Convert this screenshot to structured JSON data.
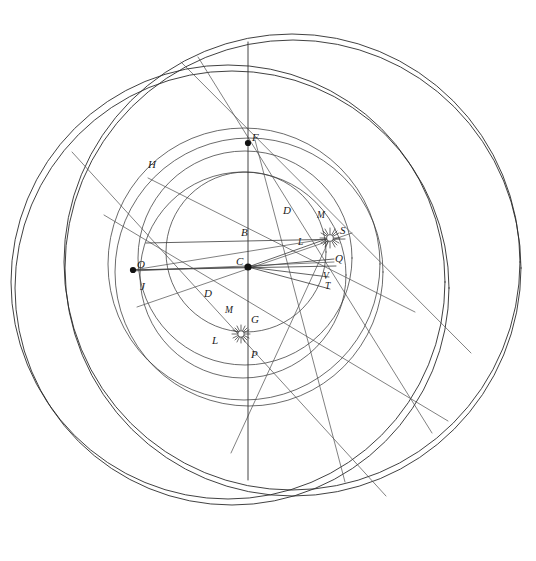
{
  "figure": {
    "canvas": {
      "width": 536,
      "height": 561
    },
    "background_color": "#ffffff",
    "ink_color": "#2b2b2b"
  },
  "points": [
    {
      "id": "F",
      "label": "F",
      "x": 248,
      "y": 143,
      "label_x": 252,
      "label_y": 134,
      "marker": "dot"
    },
    {
      "id": "H",
      "label": "H",
      "x": 150,
      "y": 175,
      "label_x": 150,
      "label_y": 161,
      "marker": "none"
    },
    {
      "id": "D_upper",
      "label": "D",
      "x": 292,
      "y": 216,
      "label_x": 284,
      "label_y": 206,
      "marker": "none"
    },
    {
      "id": "M_upper",
      "label": "M",
      "x": 322,
      "y": 222,
      "label_x": 318,
      "label_y": 212,
      "marker": "none"
    },
    {
      "id": "S",
      "label": "S",
      "x": 330,
      "y": 238,
      "label_x": 340,
      "label_y": 226,
      "marker": "burst"
    },
    {
      "id": "B",
      "label": "B",
      "x": 248,
      "y": 236,
      "label_x": 243,
      "label_y": 228,
      "marker": "none"
    },
    {
      "id": "L_upper",
      "label": "L",
      "x": 303,
      "y": 244,
      "label_x": 299,
      "label_y": 237,
      "marker": "none"
    },
    {
      "id": "Q",
      "label": "Q",
      "x": 333,
      "y": 260,
      "label_x": 335,
      "label_y": 253,
      "marker": "none"
    },
    {
      "id": "C",
      "label": "C",
      "x": 248,
      "y": 267,
      "label_x": 237,
      "label_y": 258,
      "marker": "dot"
    },
    {
      "id": "O",
      "label": "O",
      "x": 133,
      "y": 270,
      "label_x": 137,
      "label_y": 261,
      "marker": "dot"
    },
    {
      "id": "V",
      "label": "V",
      "x": 327,
      "y": 277,
      "label_x": 324,
      "label_y": 274,
      "marker": "none"
    },
    {
      "id": "J",
      "label": "J",
      "x": 144,
      "y": 290,
      "label_x": 142,
      "label_y": 282,
      "marker": "none"
    },
    {
      "id": "T",
      "label": "T",
      "x": 329,
      "y": 288,
      "label_x": 325,
      "label_y": 283,
      "marker": "none"
    },
    {
      "id": "D_lower",
      "label": "D",
      "x": 212,
      "y": 297,
      "label_x": 205,
      "label_y": 289,
      "marker": "none"
    },
    {
      "id": "M_lower",
      "label": "M",
      "x": 232,
      "y": 315,
      "label_x": 226,
      "label_y": 307,
      "marker": "none"
    },
    {
      "id": "G",
      "label": "G",
      "x": 241,
      "y": 334,
      "label_x": 251,
      "label_y": 315,
      "marker": "burst"
    },
    {
      "id": "L_lower",
      "label": "L",
      "x": 220,
      "y": 344,
      "label_x": 213,
      "label_y": 336,
      "marker": "none"
    },
    {
      "id": "P",
      "label": "P",
      "x": 248,
      "y": 360,
      "label_x": 252,
      "label_y": 350,
      "marker": "none"
    }
  ],
  "circles": [
    {
      "id": "outer-great-a",
      "cx": 292,
      "cy": 262,
      "r": 228,
      "note": "outermost great circle"
    },
    {
      "id": "outer-great-b",
      "cx": 292,
      "cy": 268,
      "r": 228,
      "note": "outermost great circle duplicate offset"
    },
    {
      "id": "eccentric-a",
      "cx": 228,
      "cy": 282,
      "r": 217,
      "note": "large eccentric circle"
    },
    {
      "id": "eccentric-b",
      "cx": 232,
      "cy": 288,
      "r": 217,
      "note": "large eccentric circle duplicate offset"
    },
    {
      "id": "deferent-a",
      "cx": 244,
      "cy": 266,
      "r": 135,
      "note": "deferent outer"
    },
    {
      "id": "deferent-b",
      "cx": 248,
      "cy": 272,
      "r": 135,
      "note": "deferent inner"
    },
    {
      "id": "mid-circle-a",
      "cx": 245,
      "cy": 259,
      "r": 106,
      "note": "middle circle upper"
    },
    {
      "id": "mid-circle-b",
      "cx": 243,
      "cy": 274,
      "r": 103,
      "note": "middle circle lower"
    },
    {
      "id": "inner-circle",
      "cx": 246,
      "cy": 252,
      "r": 80,
      "note": "innermost circle"
    }
  ],
  "rays": [
    {
      "id": "ray-C-S",
      "x1": 248,
      "y1": 267,
      "x2": 332,
      "y2": 237
    },
    {
      "id": "ray-C-Q",
      "x1": 248,
      "y1": 267,
      "x2": 334,
      "y2": 259
    },
    {
      "id": "ray-C-V",
      "x1": 248,
      "y1": 267,
      "x2": 329,
      "y2": 277
    },
    {
      "id": "ray-C-T",
      "x1": 248,
      "y1": 267,
      "x2": 330,
      "y2": 289
    },
    {
      "id": "ray-C-O",
      "x1": 248,
      "y1": 267,
      "x2": 132,
      "y2": 270
    },
    {
      "id": "chord-B",
      "x1": 146,
      "y1": 243,
      "x2": 345,
      "y2": 239
    },
    {
      "id": "chord-C",
      "x1": 133,
      "y1": 270,
      "x2": 336,
      "y2": 266
    },
    {
      "id": "long-ray-1",
      "x1": 72,
      "y1": 152,
      "x2": 386,
      "y2": 496
    },
    {
      "id": "long-ray-2",
      "x1": 104,
      "y1": 215,
      "x2": 448,
      "y2": 421
    },
    {
      "id": "long-ray-3",
      "x1": 198,
      "y1": 57,
      "x2": 432,
      "y2": 433
    },
    {
      "id": "long-ray-4",
      "x1": 181,
      "y1": 62,
      "x2": 471,
      "y2": 353
    },
    {
      "id": "long-ray-5",
      "x1": 137,
      "y1": 307,
      "x2": 352,
      "y2": 233
    },
    {
      "id": "long-ray-6",
      "x1": 148,
      "y1": 178,
      "x2": 415,
      "y2": 312
    },
    {
      "id": "long-ray-7",
      "x1": 255,
      "y1": 140,
      "x2": 345,
      "y2": 482
    },
    {
      "id": "long-ray-8",
      "x1": 330,
      "y1": 238,
      "x2": 231,
      "y2": 453
    }
  ],
  "axis": {
    "id": "vertical-axis",
    "x1": 248,
    "y1": 42,
    "x2": 248,
    "y2": 480
  },
  "labels_list": [
    "F",
    "H",
    "D",
    "M",
    "S",
    "B",
    "L",
    "Q",
    "C",
    "O",
    "V",
    "J",
    "T",
    "D",
    "M",
    "G",
    "L",
    "P"
  ]
}
